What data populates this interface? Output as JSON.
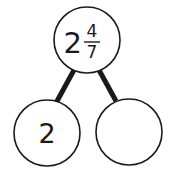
{
  "diagram": {
    "type": "number-bond",
    "whole": {
      "whole_part": "2",
      "numerator": "4",
      "denominator": "7"
    },
    "parts": [
      {
        "label": "2"
      },
      {
        "label": ""
      }
    ],
    "colors": {
      "stroke": "#1a1a1a",
      "fill": "#ffffff"
    }
  }
}
